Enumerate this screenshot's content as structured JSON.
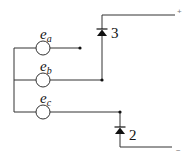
{
  "diagram": {
    "type": "circuit-schematic",
    "sources": [
      {
        "id": "ea",
        "label": "e",
        "subscript": "a"
      },
      {
        "id": "eb",
        "label": "e",
        "subscript": "b"
      },
      {
        "id": "ec",
        "label": "e",
        "subscript": "c"
      }
    ],
    "diodes": [
      {
        "id": "d3",
        "label": "3"
      },
      {
        "id": "d2",
        "label": "2"
      }
    ],
    "terminals": {
      "positive": "+",
      "negative": "−"
    },
    "colors": {
      "wire": "#333333",
      "background": "#ffffff"
    }
  }
}
